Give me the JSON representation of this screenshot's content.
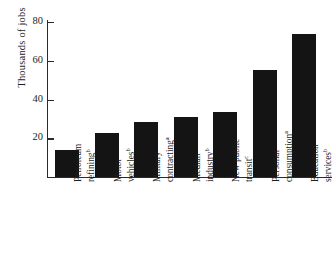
{
  "chart_data": {
    "type": "bar",
    "title": "",
    "xlabel": "",
    "ylabel": "Thousands of jobs",
    "ylim": [
      0,
      80
    ],
    "yticks": [
      0,
      20,
      40,
      60,
      80
    ],
    "ytick_labels": [
      "",
      "20",
      "40",
      "60",
      "80"
    ],
    "grid": false,
    "legend": null,
    "bar_color": "#141414",
    "axis_color": "#2b2b2b",
    "categories": [
      "Petroleum refining",
      "Motor vehicles",
      "Military contracting",
      "Median industry",
      "New public transit",
      "Personal consumption",
      "Education services"
    ],
    "category_footnotes": [
      "b",
      "b",
      "a",
      "b",
      "c",
      "a",
      "b"
    ],
    "values": [
      14,
      22.5,
      28.5,
      31,
      33.5,
      55,
      74
    ]
  },
  "axis": {
    "y_title": "Thousands of jobs",
    "ticks": [
      {
        "label": "80",
        "value": 80
      },
      {
        "label": "60",
        "value": 60
      },
      {
        "label": "40",
        "value": 40
      },
      {
        "label": "20",
        "value": 20
      }
    ]
  },
  "bars": [
    {
      "line1": "Petroleum",
      "line2": "refining",
      "footnote": "b",
      "value": 14
    },
    {
      "line1": "Motor",
      "line2": "vehicles",
      "footnote": "b",
      "value": 22.5
    },
    {
      "line1": "Military",
      "line2": "contracting",
      "footnote": "a",
      "value": 28.5
    },
    {
      "line1": "Median",
      "line2": "industry",
      "footnote": "b",
      "value": 31
    },
    {
      "line1": "New public",
      "line2": "transit",
      "footnote": "c",
      "value": 33.5
    },
    {
      "line1": "Personal",
      "line2": "consumption",
      "footnote": "a",
      "value": 55
    },
    {
      "line1": "Education",
      "line2": "services",
      "footnote": "b",
      "value": 74
    }
  ]
}
